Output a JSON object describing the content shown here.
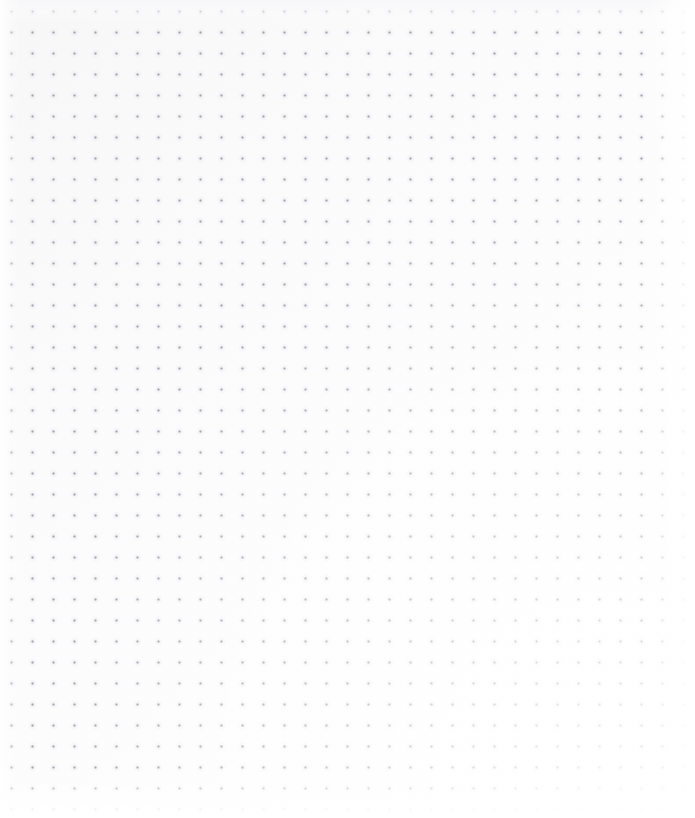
{
  "canvas": {
    "name": "dot-grid-canvas",
    "state": "empty",
    "empty_state_text": "",
    "background_color": "#fcfcfd",
    "surface_gradient_start": "#f7f7f8",
    "surface_gradient_end": "#ffffff",
    "grid": {
      "style": "dot",
      "dot_color": "#9696a2",
      "dot_diameter_px": 2,
      "spacing_px": 21,
      "origin_x_px": 22,
      "origin_y_px": 22,
      "columns": 31,
      "rows": 37,
      "visible": true
    },
    "margins": {
      "top_px": 22,
      "left_px": 22,
      "right_px": 24,
      "bottom_px": 26
    }
  }
}
